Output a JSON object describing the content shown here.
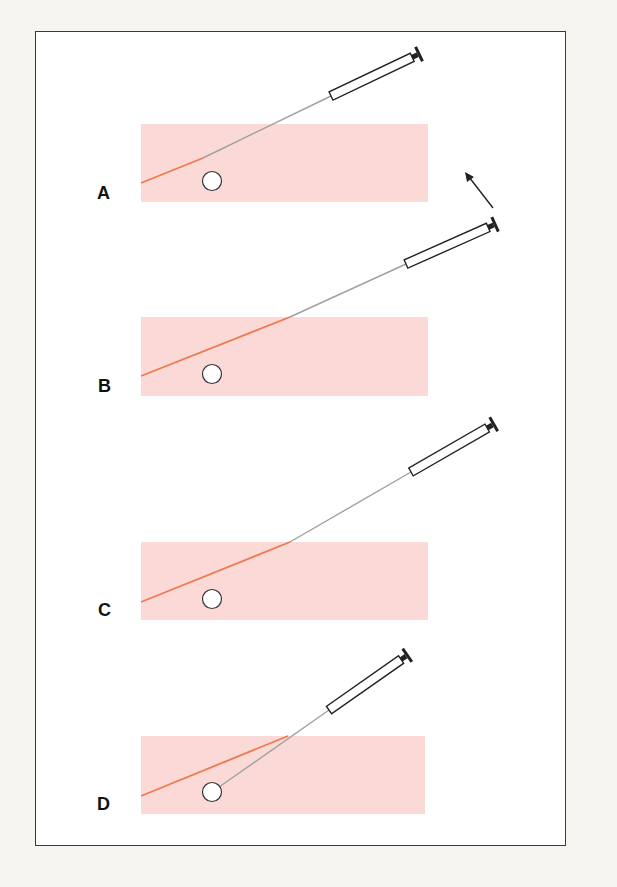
{
  "figure": {
    "colors": {
      "background": "#f7f5ef",
      "frame_border": "#3a3a3a",
      "tissue": "#fbd9d6",
      "needle_track": "#ee7a4f",
      "needle": "#a0a0a0",
      "syringe_outline": "#222222",
      "target": "#ffffff"
    },
    "panels": [
      {
        "label": "A",
        "caption": "Needle advanced toward target"
      },
      {
        "label": "B",
        "caption": "Needle withdrawn to tissue surface"
      },
      {
        "label": "C",
        "caption": "Angle of syringe changed"
      },
      {
        "label": "D",
        "caption": "Needle redirected into target"
      }
    ],
    "arrow": {
      "meaning": "direction-of-syringe-angle-change"
    }
  }
}
